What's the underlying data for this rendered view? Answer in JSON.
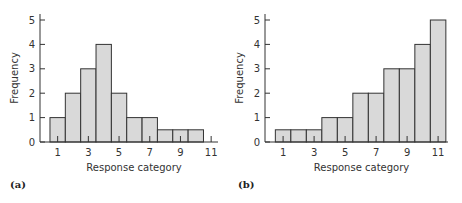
{
  "chart_data": [
    {
      "type": "bar",
      "panel_label": "(a)",
      "title": "",
      "xlabel": "Response category",
      "ylabel": "Frequency",
      "categories": [
        1,
        2,
        3,
        4,
        5,
        6,
        7,
        8,
        9,
        10
      ],
      "values": [
        1,
        2,
        3,
        4,
        2,
        1,
        1,
        0.5,
        0.5,
        0.5
      ],
      "x_ticks": [
        1,
        3,
        5,
        7,
        9,
        11
      ],
      "y_ticks": [
        0,
        1,
        2,
        3,
        4,
        5
      ],
      "xlim": [
        0,
        11.5
      ],
      "ylim": [
        0,
        5
      ],
      "grid": false,
      "bar_color": "#d9d9d9",
      "edge_color": "#333333"
    },
    {
      "type": "bar",
      "panel_label": "(b)",
      "title": "",
      "xlabel": "Response category",
      "ylabel": "Frequency",
      "categories": [
        1,
        2,
        3,
        4,
        5,
        6,
        7,
        8,
        9,
        10,
        11
      ],
      "values": [
        0.5,
        0.5,
        0.5,
        1,
        1,
        2,
        2,
        3,
        3,
        4,
        5
      ],
      "x_ticks": [
        1,
        3,
        5,
        7,
        9,
        11
      ],
      "y_ticks": [
        0,
        1,
        2,
        3,
        4,
        5
      ],
      "xlim": [
        0,
        11.5
      ],
      "ylim": [
        0,
        5
      ],
      "grid": false,
      "bar_color": "#d9d9d9",
      "edge_color": "#333333"
    }
  ]
}
